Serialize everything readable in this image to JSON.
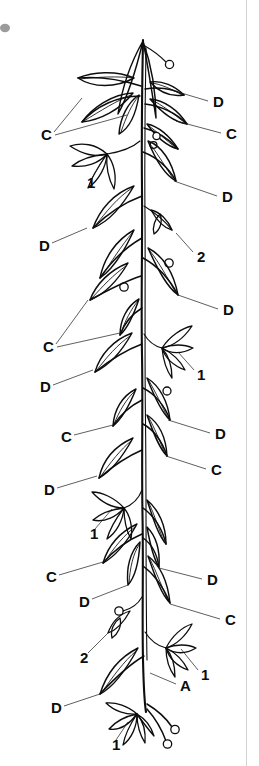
{
  "figure": {
    "background_color": "#ffffff",
    "ink_color": "#0d0d0d",
    "width": 259,
    "height": 766
  },
  "labels": [
    {
      "id": "l01",
      "text": "D",
      "side": "right",
      "x": 213,
      "y": 103,
      "leader": "M 208 101 L 168 89"
    },
    {
      "id": "l02",
      "text": "C",
      "side": "right",
      "x": 226,
      "y": 135,
      "leader": "M 221 133 L 176 121"
    },
    {
      "id": "l03",
      "text": "C",
      "side": "left",
      "x": 41,
      "y": 136,
      "leader": "M 54 132 L 82 98"
    },
    {
      "id": "l04",
      "text": "C",
      "side": "left",
      "x": 41,
      "y": 136,
      "leader": "M 55 135 L 127 115"
    },
    {
      "id": "l05",
      "text": "1",
      "side": "left",
      "x": 87,
      "y": 184,
      "leader": "M 92 178 L 104 158"
    },
    {
      "id": "l06",
      "text": "D",
      "side": "right",
      "x": 222,
      "y": 198,
      "leader": "M 217 196 L 174 181"
    },
    {
      "id": "l07",
      "text": "D",
      "side": "left",
      "x": 39,
      "y": 247,
      "leader": "M 52 243 L 87 228"
    },
    {
      "id": "l08",
      "text": "2",
      "side": "right",
      "x": 197,
      "y": 258,
      "leader": "M 193 252 L 176 233"
    },
    {
      "id": "l09",
      "text": "D",
      "side": "right",
      "x": 223,
      "y": 311,
      "leader": "M 218 309 L 178 295"
    },
    {
      "id": "l10",
      "text": "C",
      "side": "left",
      "x": 43,
      "y": 348,
      "leader": "M 56 344 L 88 300"
    },
    {
      "id": "l11",
      "text": "C",
      "side": "left",
      "x": 43,
      "y": 348,
      "leader": "M 57 347 L 120 333"
    },
    {
      "id": "l12",
      "text": "1",
      "side": "right",
      "x": 197,
      "y": 376,
      "leader": "M 194 370 L 178 352"
    },
    {
      "id": "l13",
      "text": "D",
      "side": "left",
      "x": 40,
      "y": 388,
      "leader": "M 53 385 L 93 370"
    },
    {
      "id": "l14",
      "text": "D",
      "side": "right",
      "x": 215,
      "y": 435,
      "leader": "M 210 433 L 168 420"
    },
    {
      "id": "l15",
      "text": "C",
      "side": "left",
      "x": 61,
      "y": 438,
      "leader": "M 74 435 L 113 425"
    },
    {
      "id": "l16",
      "text": "C",
      "side": "right",
      "x": 211,
      "y": 471,
      "leader": "M 206 469 L 166 456"
    },
    {
      "id": "l17",
      "text": "D",
      "side": "left",
      "x": 44,
      "y": 491,
      "leader": "M 57 488 L 97 476"
    },
    {
      "id": "l18",
      "text": "1",
      "side": "left",
      "x": 90,
      "y": 535,
      "leader": "M 95 529 L 112 509"
    },
    {
      "id": "l19",
      "text": "C",
      "side": "left",
      "x": 46,
      "y": 578,
      "leader": "M 59 575 L 103 562"
    },
    {
      "id": "l20",
      "text": "D",
      "side": "right",
      "x": 207,
      "y": 581,
      "leader": "M 202 579 L 159 568"
    },
    {
      "id": "l21",
      "text": "D",
      "side": "left",
      "x": 79,
      "y": 603,
      "leader": "M 92 599 L 128 585"
    },
    {
      "id": "l22",
      "text": "C",
      "side": "right",
      "x": 225,
      "y": 621,
      "leader": "M 220 619 L 170 604"
    },
    {
      "id": "l23",
      "text": "2",
      "side": "left",
      "x": 80,
      "y": 659,
      "leader": "M 88 653 L 108 633"
    },
    {
      "id": "l24",
      "text": "1",
      "side": "right",
      "x": 201,
      "y": 676,
      "leader": "M 198 670 L 181 649"
    },
    {
      "id": "l25",
      "text": "A",
      "side": "right",
      "x": 180,
      "y": 687,
      "leader": "M 176 684 L 150 673"
    },
    {
      "id": "l26",
      "text": "D",
      "side": "left",
      "x": 51,
      "y": 709,
      "leader": "M 64 706 L 100 694"
    },
    {
      "id": "l27",
      "text": "1",
      "side": "left",
      "x": 112,
      "y": 746,
      "leader": "M 116 740 L 128 722"
    }
  ],
  "legend_keys": {
    "A": "A",
    "C": "C",
    "D": "D",
    "one": "1",
    "two": "2"
  }
}
